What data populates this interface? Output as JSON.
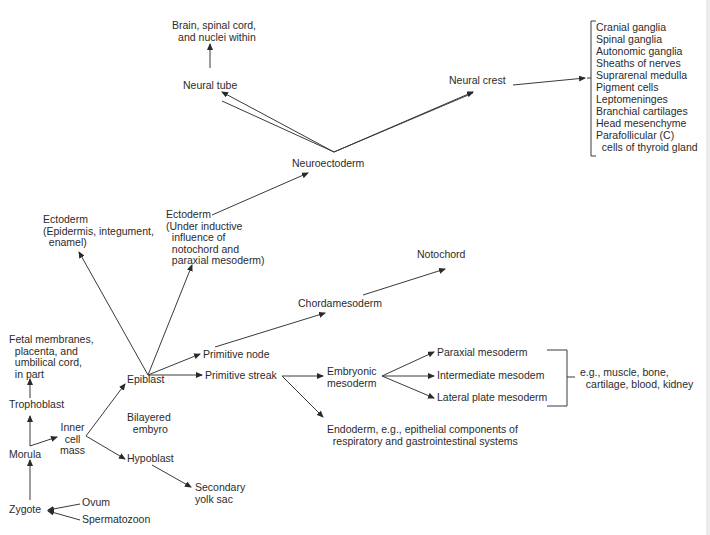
{
  "diagram": {
    "title": "",
    "nodes": {
      "brain": "Brain, spinal cord,\n  and nuclei within",
      "neural_tube": "Neural tube",
      "neural_crest": "Neural crest",
      "neuroectoderm": "Neuroectoderm",
      "ectoderm_surface": "Ectoderm\n(Epidermis, integument,\n  enamel)",
      "ectoderm_neural": "Ectoderm\n(Under inductive\n  influence of\n  notochord and\n  paraxial mesoderm)",
      "notochord": "Notochord",
      "chordamesoderm": "Chordamesoderm",
      "fetal_membranes": "Fetal membranes,\n  placenta, and\n  umbilical cord,\n  in part",
      "trophoblast": "Trophoblast",
      "morula": "Morula",
      "zygote": "Zygote",
      "ovum": "Ovum",
      "spermatozoon": "Spermatozoon",
      "inner_cell_mass": "Inner\ncell\nmass",
      "epiblast": "Epiblast",
      "hypoblast": "Hypoblast",
      "bilayered_embryo": "Bilayered\n  embyro",
      "secondary_yolk_sac": "Secondary\nyolk sac",
      "primitive_node": "Primitive node",
      "primitive_streak": "Primitive streak",
      "embryonic_mesoderm": "Embryonic\nmesoderm",
      "paraxial_mesoderm": "Paraxial mesoderm",
      "intermediate_mesoderm": "Intermediate mesodem",
      "lateral_plate_mesoderm": "Lateral plate mesoderm",
      "mesoderm_derivatives": "e.g., muscle, bone,\n  cartilage, blood, kidney",
      "endoderm": "Endoderm, e.g., epithelial components of\n  respiratory and gastrointestinal systems"
    },
    "neural_crest_derivatives": [
      "Cranial ganglia",
      "Spinal ganglia",
      "Autonomic ganglia",
      "Sheaths of nerves",
      "Suprarenal medulla",
      "Pigment cells",
      "Leptomeninges",
      "Branchial cartilages",
      "Head mesenchyme",
      "Parafollicular (C)",
      "  cells of thyroid gland"
    ],
    "colors": {
      "text": "#2b2b2b",
      "line": "#3a3a3a",
      "background": "#ffffff"
    }
  }
}
